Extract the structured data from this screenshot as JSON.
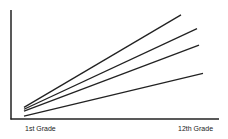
{
  "chart_data": {
    "type": "line",
    "title": "",
    "xlabel": "",
    "ylabel": "",
    "categories": [
      "1st Grade",
      "12th Grade"
    ],
    "x": [
      1,
      12
    ],
    "series": [
      {
        "name": "Line 1",
        "values": [
          12,
          107
        ]
      },
      {
        "name": "Line 2",
        "values": [
          10,
          93
        ]
      },
      {
        "name": "Line 3",
        "values": [
          8,
          76
        ]
      },
      {
        "name": "Line 4",
        "values": [
          3,
          47
        ]
      }
    ],
    "ylim": [
      0,
      110
    ],
    "grid": false,
    "legend": "none",
    "colors": {
      "line": "#222222",
      "axis": "#222222"
    }
  },
  "labels": {
    "x_start": "1st Grade",
    "x_end": "12th Grade"
  }
}
